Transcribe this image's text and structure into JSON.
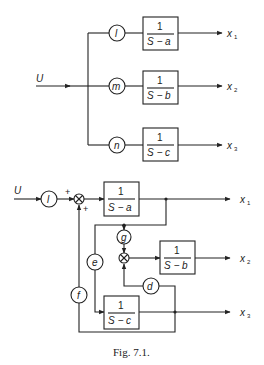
{
  "figure": {
    "caption": "Fig. 7.1.",
    "top": {
      "input_label": "U",
      "gains": [
        "l",
        "m",
        "n"
      ],
      "blocks": [
        {
          "num": "1",
          "den": "S − a"
        },
        {
          "num": "1",
          "den": "S − b"
        },
        {
          "num": "1",
          "den": "S − c"
        }
      ],
      "outputs": [
        {
          "var": "x",
          "sub": "1"
        },
        {
          "var": "x",
          "sub": "2"
        },
        {
          "var": "x",
          "sub": "3"
        }
      ]
    },
    "bottom": {
      "input_label": "U",
      "input_gain": "l",
      "sum_signs": [
        "+",
        "+"
      ],
      "gains": {
        "e": "e",
        "f": "f",
        "g": "g",
        "d": "d"
      },
      "blocks": [
        {
          "num": "1",
          "den": "S − a"
        },
        {
          "num": "1",
          "den": "S − b"
        },
        {
          "num": "1",
          "den": "S − c"
        }
      ],
      "outputs": [
        {
          "var": "x",
          "sub": "1"
        },
        {
          "var": "x",
          "sub": "2"
        },
        {
          "var": "x",
          "sub": "3"
        }
      ]
    }
  }
}
